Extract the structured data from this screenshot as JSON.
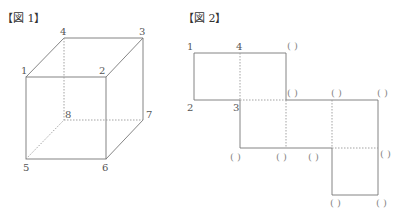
{
  "figure1": {
    "title": "【図 1】",
    "vertex_labels": {
      "v1": "1",
      "v2": "2",
      "v3": "3",
      "v4": "4",
      "v5": "5",
      "v6": "6",
      "v7": "7",
      "v8": "8"
    }
  },
  "figure2": {
    "title": "【図 2】",
    "vertex_labels": {
      "v1": "1",
      "v4": "4",
      "v2": "2",
      "v3": "3"
    },
    "blank_label": "(　)",
    "blanks": [
      "( )",
      "( )",
      "( )",
      "( )",
      "( )",
      "( )",
      "( )",
      "( )",
      "( )",
      "( )"
    ]
  },
  "colors": {
    "line": "#777777",
    "dashed": "#999999",
    "text": "#555555"
  }
}
